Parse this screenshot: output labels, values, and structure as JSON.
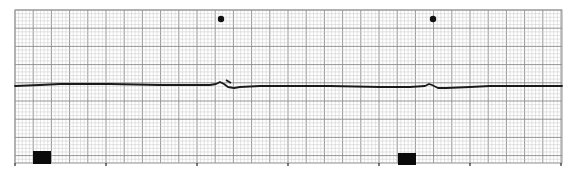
{
  "strip": {
    "type": "ecg-rhythm-strip",
    "grid": {
      "left": 15,
      "top": 10,
      "right": 562,
      "bottom": 163,
      "minor_px": 3.64,
      "major_px": 18.2,
      "minor_color": "#c8c8c8",
      "major_color": "#8a8a8a",
      "border_color": "#9a9a9a"
    },
    "trace_color": "#1a1a1a",
    "baseline_y": 86,
    "time_ticks_x": [
      15,
      106,
      197,
      288,
      379,
      470,
      561
    ],
    "beat_markers": [
      {
        "x": 221,
        "y": 19,
        "icon": "dot"
      },
      {
        "x": 433,
        "y": 19,
        "icon": "dot"
      }
    ],
    "event_boxes": [
      {
        "x": 33,
        "y": 151,
        "w": 18,
        "h": 13
      },
      {
        "x": 398,
        "y": 153,
        "w": 18,
        "h": 12
      }
    ],
    "annotation_marks": [
      {
        "x1": 226,
        "y1": 80,
        "x2": 231,
        "y2": 83
      }
    ]
  }
}
